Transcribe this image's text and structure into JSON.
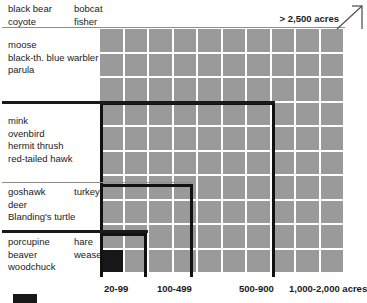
{
  "chart_data": {
    "type": "heatmap",
    "title": "",
    "xlabel": "",
    "ylabel": "",
    "grid": {
      "columns": 10,
      "rows": 10,
      "cell_color": "#9a9a9a",
      "highlight_color": "#171717",
      "highlight_cells": [
        {
          "row": 9,
          "col": 0
        }
      ]
    },
    "x_tick_labels": [
      "20-99",
      "100-499",
      "500-900",
      "1,000-2,000 acres"
    ],
    "annotation": "> 2,500 acres",
    "groups": [
      {
        "id": "group-largest",
        "rows": 2,
        "species_left": [
          "black bear",
          "coyote"
        ],
        "species_right": [
          "bobcat",
          "fisher"
        ]
      },
      {
        "id": "group-large",
        "rows": 3,
        "species_left": [
          "moose",
          "black-th. blue warbler",
          "parula"
        ],
        "species_right": []
      },
      {
        "id": "group-medium",
        "rows": 4,
        "species_left": [
          "mink",
          "ovenbird",
          "hermit thrush",
          "red-tailed hawk"
        ],
        "species_right": []
      },
      {
        "id": "group-small",
        "rows": 3,
        "species_left": [
          "goshawk",
          "deer",
          "Blanding's turtle"
        ],
        "species_right": [
          "turkey"
        ]
      },
      {
        "id": "group-smallest",
        "rows": 3,
        "species_left": [
          "porcupine",
          "beaver",
          "woodchuck"
        ],
        "species_right": [
          "hare",
          "weasel"
        ]
      }
    ],
    "nested_boxes": [
      {
        "id": "box-medium",
        "left": 100,
        "top": 102,
        "width": 175,
        "height": 175
      },
      {
        "id": "box-small",
        "left": 100,
        "top": 184,
        "width": 93,
        "height": 93
      },
      {
        "id": "box-smallest",
        "left": 100,
        "top": 233,
        "width": 47,
        "height": 44
      }
    ]
  },
  "colors": {
    "cell": "#9a9a9a",
    "highlight": "#171717",
    "outline": "#111111",
    "text": "#1a1a1a"
  }
}
